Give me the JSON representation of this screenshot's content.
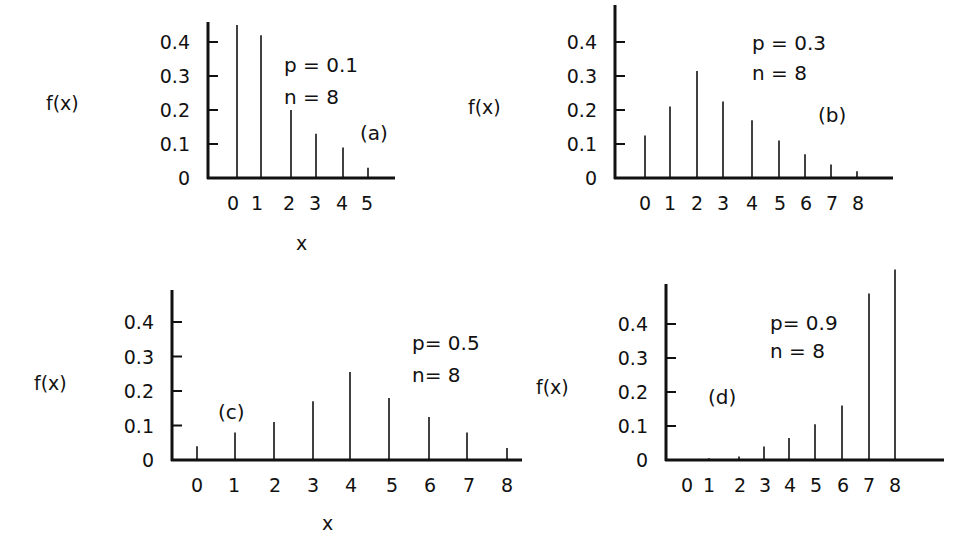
{
  "chart_data": [
    {
      "type": "bar",
      "panel": "(a)",
      "title": "",
      "annotations": [
        "p = 0.1",
        "n = 8",
        "(a)"
      ],
      "p": 0.1,
      "n": 8,
      "xlabel": "x",
      "ylabel": "f(x)",
      "categories": [
        "0",
        "1",
        "2",
        "3",
        "4",
        "5"
      ],
      "values": [
        0.43,
        0.38,
        0.15,
        0.03,
        0.005,
        0.0004
      ],
      "drawn_heights": [
        0.45,
        0.42,
        0.2,
        0.13,
        0.09,
        0.03
      ],
      "yticks": [
        "0",
        "0.1",
        "0.2",
        "0.3",
        "0.4"
      ],
      "ylim": [
        0,
        0.45
      ],
      "grid": false
    },
    {
      "type": "bar",
      "panel": "(b)",
      "annotations": [
        "p = 0.3",
        "n = 8",
        "(b)"
      ],
      "p": 0.3,
      "n": 8,
      "xlabel": "",
      "ylabel": "f(x)",
      "categories": [
        "0",
        "1",
        "2",
        "3",
        "4",
        "5",
        "6",
        "7",
        "8"
      ],
      "values": [
        0.12,
        0.21,
        0.31,
        0.23,
        0.17,
        0.11,
        0.07,
        0.04,
        0.02
      ],
      "yticks": [
        "0",
        "0.1",
        "0.2",
        "0.3",
        "0.4"
      ],
      "ylim": [
        0,
        0.5
      ],
      "grid": false
    },
    {
      "type": "bar",
      "panel": "(c)",
      "annotations": [
        "p = 0.5",
        "n = 8",
        "(c)"
      ],
      "p": 0.5,
      "n": 8,
      "xlabel": "x",
      "ylabel": "f(x)",
      "categories": [
        "0",
        "1",
        "2",
        "3",
        "4",
        "5",
        "6",
        "7",
        "8"
      ],
      "values": [
        0.04,
        0.08,
        0.11,
        0.17,
        0.26,
        0.18,
        0.12,
        0.08,
        0.03
      ],
      "yticks": [
        "0",
        "0.1",
        "0.2",
        "0.3",
        "0.4"
      ],
      "ylim": [
        0,
        0.5
      ],
      "grid": false
    },
    {
      "type": "bar",
      "panel": "(d)",
      "annotations": [
        "p = 0.9",
        "n = 8",
        "(d)"
      ],
      "p": 0.9,
      "n": 8,
      "xlabel": "",
      "ylabel": "f(x)",
      "categories": [
        "0",
        "1",
        "2",
        "3",
        "4",
        "5",
        "6",
        "7",
        "8"
      ],
      "values": [
        0.0,
        0.005,
        0.01,
        0.04,
        0.07,
        0.11,
        0.16,
        0.49,
        0.56
      ],
      "yticks": [
        "0",
        "0.1",
        "0.2",
        "0.3",
        "0.4"
      ],
      "ylim": [
        0,
        0.56
      ],
      "grid": false
    }
  ],
  "panels": {
    "a": {
      "p_label": "p = 0.1",
      "n_label": "n = 8",
      "tag": "(a)",
      "ylabel": "f(x)",
      "xlabel": "x",
      "yticks": [
        "0",
        "0.1",
        "0.2",
        "0.3",
        "0.4"
      ],
      "xticks": [
        "0",
        "1",
        "2",
        "3",
        "4",
        "5"
      ]
    },
    "b": {
      "p_label": "p = 0.3",
      "n_label": "n = 8",
      "tag": "(b)",
      "ylabel": "f(x)",
      "yticks": [
        "0",
        "0.1",
        "0.2",
        "0.3",
        "0.4"
      ],
      "xticks": [
        "0",
        "1",
        "2",
        "3",
        "4",
        "5",
        "6",
        "7",
        "8"
      ]
    },
    "c": {
      "p_label": "p= 0.5",
      "n_label": "n= 8",
      "tag": "(c)",
      "ylabel": "f(x)",
      "xlabel": "x",
      "yticks": [
        "0",
        "0.1",
        "0.2",
        "0.3",
        "0.4"
      ],
      "xticks": [
        "0",
        "1",
        "2",
        "3",
        "4",
        "5",
        "6",
        "7",
        "8"
      ]
    },
    "d": {
      "p_label": "p= 0.9",
      "n_label": "n = 8",
      "tag": "(d)",
      "ylabel": "f(x)",
      "yticks": [
        "0",
        "0.1",
        "0.2",
        "0.3",
        "0.4"
      ],
      "xticks": [
        "0",
        "1",
        "2",
        "3",
        "4",
        "5",
        "6",
        "7",
        "8"
      ]
    }
  },
  "layout": {
    "a": {
      "axis_x": 208,
      "base_y": 178,
      "top_y": 22,
      "end_x": 395,
      "ppu": 340,
      "bar_x": [
        237,
        261,
        291,
        316,
        343,
        368
      ],
      "tick_x": [
        233,
        257,
        289,
        315,
        342,
        367
      ],
      "heights": [
        0.45,
        0.42,
        0.2,
        0.13,
        0.09,
        0.03
      ]
    },
    "b": {
      "axis_x": 615,
      "base_y": 178,
      "top_y": 5,
      "end_x": 893,
      "ppu": 340,
      "bar_x": [
        645,
        670,
        697,
        723,
        752,
        779,
        805,
        831,
        857
      ],
      "tick_x": [
        645,
        670,
        697,
        723,
        752,
        780,
        806,
        832,
        858
      ],
      "heights": [
        0.125,
        0.21,
        0.315,
        0.225,
        0.17,
        0.11,
        0.07,
        0.04,
        0.02
      ]
    },
    "c": {
      "axis_x": 172,
      "base_y": 460,
      "top_y": 290,
      "end_x": 522,
      "ppu": 345,
      "bar_x": [
        197,
        235,
        274,
        313,
        350,
        389,
        429,
        467,
        507
      ],
      "tick_x": [
        197,
        234,
        275,
        313,
        351,
        392,
        430,
        469,
        507
      ],
      "heights": [
        0.04,
        0.08,
        0.11,
        0.17,
        0.255,
        0.18,
        0.125,
        0.08,
        0.035
      ]
    },
    "d": {
      "axis_x": 666,
      "base_y": 460,
      "top_y": 284,
      "end_x": 944,
      "ppu": 340,
      "bar_x": [
        709,
        739,
        764,
        789,
        815,
        842,
        869,
        895
      ],
      "tick_x": [
        687,
        709,
        740,
        765,
        790,
        816,
        843,
        869,
        895
      ],
      "heights": [
        0.005,
        0.01,
        0.04,
        0.065,
        0.105,
        0.16,
        0.49,
        0.56
      ]
    }
  }
}
